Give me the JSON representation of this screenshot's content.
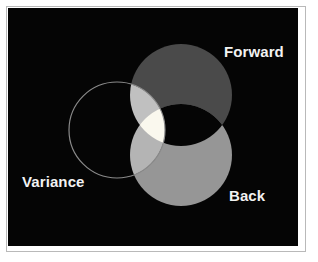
{
  "figure": {
    "type": "venn-diagram",
    "set_count": 3,
    "background_color": "#050505",
    "border_color": "#b9b9b9",
    "frame_color": "#ffffff"
  },
  "labels": {
    "forward": "Forward",
    "back": "Back",
    "variance": "Variance",
    "text_color": "#f2f2f2"
  },
  "sets": [
    {
      "name": "Forward",
      "label": "Forward",
      "style": "filled",
      "fill_color": "#4a4a4a",
      "stroke_color": "none",
      "cx": 173,
      "cy": 87,
      "r": 51
    },
    {
      "name": "Back",
      "label": "Back",
      "style": "filled",
      "fill_color": "#969696",
      "stroke_color": "none",
      "cx": 173,
      "cy": 147,
      "r": 51
    },
    {
      "name": "Variance",
      "label": "Variance",
      "style": "outline",
      "fill_color": "none",
      "stroke_color": "#8a8a8a",
      "cx": 109,
      "cy": 122,
      "r": 48
    }
  ],
  "regions": [
    {
      "name": "forward-only",
      "sets": [
        "Forward"
      ],
      "color": "#4a4a4a"
    },
    {
      "name": "back-only",
      "sets": [
        "Back"
      ],
      "color": "#969696"
    },
    {
      "name": "variance-only",
      "sets": [
        "Variance"
      ],
      "color": "#050505"
    },
    {
      "name": "forward-back",
      "sets": [
        "Forward",
        "Back"
      ],
      "color": "#050505"
    },
    {
      "name": "forward-variance",
      "sets": [
        "Forward",
        "Variance"
      ],
      "color": "#c0c0c0"
    },
    {
      "name": "back-variance",
      "sets": [
        "Back",
        "Variance"
      ],
      "color": "#b4b4b4"
    },
    {
      "name": "forward-back-variance",
      "sets": [
        "Forward",
        "Back",
        "Variance"
      ],
      "color": "#faf8ee"
    }
  ]
}
